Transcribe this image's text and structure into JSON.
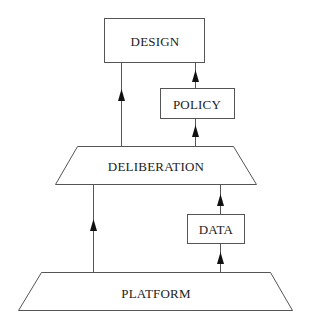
{
  "diagram": {
    "nodes": {
      "design": {
        "label": "DESIGN",
        "shape": "rectangle"
      },
      "policy": {
        "label": "POLICY",
        "shape": "rectangle"
      },
      "deliberation": {
        "label": "DELIBERATION",
        "shape": "trapezoid"
      },
      "data": {
        "label": "DATA",
        "shape": "rectangle"
      },
      "platform": {
        "label": "PLATFORM",
        "shape": "trapezoid"
      }
    },
    "edges": [
      {
        "from": "deliberation",
        "to": "design",
        "arrow": "up"
      },
      {
        "from": "policy",
        "to": "design",
        "arrow": "up"
      },
      {
        "from": "deliberation",
        "to": "policy",
        "arrow": "up"
      },
      {
        "from": "platform",
        "to": "deliberation",
        "arrow": "up"
      },
      {
        "from": "data",
        "to": "deliberation",
        "arrow": "up"
      },
      {
        "from": "platform",
        "to": "data",
        "arrow": "up"
      }
    ],
    "colors": {
      "stroke": "#555555",
      "text": "#222222",
      "arrow": "#111111",
      "background": "#ffffff"
    }
  }
}
